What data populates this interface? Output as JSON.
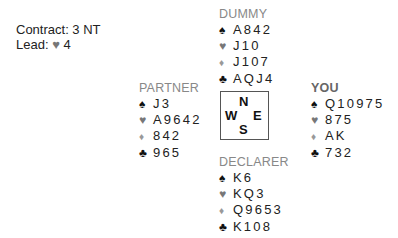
{
  "info": {
    "contract": "Contract: 3 NT",
    "lead_prefix": "Lead: ",
    "lead_suit": "♥",
    "lead_card": "4"
  },
  "compass": {
    "north": "N",
    "west": "W",
    "east": "E",
    "south": "S"
  },
  "suit_symbols": {
    "spade": "♠",
    "heart": "♥",
    "diamond": "♦",
    "club": "♣"
  },
  "hands": {
    "dummy": {
      "label": "DUMMY",
      "spades": "A842",
      "hearts": "J10",
      "diamonds": "J107",
      "clubs": "AQJ4"
    },
    "partner": {
      "label": "PARTNER",
      "spades": "J3",
      "hearts": "A9642",
      "diamonds": "842",
      "clubs": "965"
    },
    "you": {
      "label": "YOU",
      "spades": "Q10975",
      "hearts": "875",
      "diamonds": "AK",
      "clubs": "732"
    },
    "declarer": {
      "label": "DECLARER",
      "spades": "K6",
      "hearts": "KQ3",
      "diamonds": "Q9653",
      "clubs": "K108"
    }
  },
  "colors": {
    "spade": "#111111",
    "heart": "#777777",
    "diamond": "#999999",
    "club": "#111111",
    "label": "#888888"
  }
}
